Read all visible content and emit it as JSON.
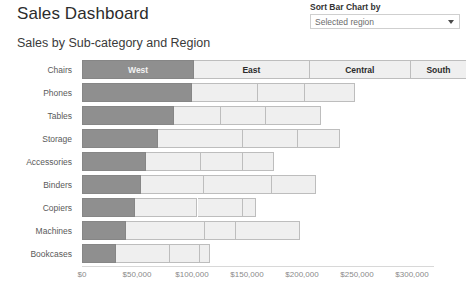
{
  "dashboard": {
    "title": "Sales Dashboard",
    "sheet_title": "Sales by Sub-category and Region"
  },
  "sort_control": {
    "label": "Sort Bar Chart by",
    "value": "Selected region",
    "caret_icon": "chevron-down-icon"
  },
  "colors": {
    "west_fill": "#8f8f8f",
    "other_fill": "#efefef",
    "border": "#bdbdbd",
    "text": "#5a5a5a"
  },
  "chart_data": {
    "type": "bar",
    "subtype": "stacked-horizontal",
    "title": "Sales by Sub-category and Region",
    "xlabel": "",
    "ylabel": "",
    "xlim": [
      0,
      320000
    ],
    "grid": false,
    "legend_position": "top-inline-first-row",
    "regions": [
      "West",
      "East",
      "Central",
      "South"
    ],
    "categories": [
      "Chairs",
      "Phones",
      "Tables",
      "Storage",
      "Accessories",
      "Binders",
      "Copiers",
      "Machines",
      "Bookcases"
    ],
    "tick_labels": [
      "$0",
      "$50,000",
      "$100,000",
      "$150,000",
      "$200,000",
      "$250,000",
      "$300,000"
    ],
    "tick_values": [
      0,
      50000,
      100000,
      150000,
      200000,
      250000,
      300000
    ],
    "series": [
      {
        "name": "West",
        "values": [
          102000,
          100000,
          84000,
          69000,
          58000,
          54000,
          48000,
          40000,
          31000
        ]
      },
      {
        "name": "East",
        "values": [
          105000,
          60000,
          42000,
          77000,
          50000,
          57000,
          57000,
          72000,
          49000
        ]
      },
      {
        "name": "Central",
        "values": [
          92000,
          43000,
          41000,
          50000,
          38000,
          62000,
          41000,
          28000,
          27000
        ]
      },
      {
        "name": "South",
        "values": [
          51000,
          45000,
          50000,
          39000,
          29000,
          40000,
          12000,
          58000,
          9000
        ]
      }
    ],
    "rows": [
      {
        "category": "Chairs",
        "segments": [
          {
            "region": "West",
            "value": 102000,
            "label": "West"
          },
          {
            "region": "East",
            "value": 105000,
            "label": "East"
          },
          {
            "region": "Central",
            "value": 92000,
            "label": "Central"
          },
          {
            "region": "South",
            "value": 51000,
            "label": "South"
          }
        ]
      },
      {
        "category": "Phones",
        "segments": [
          {
            "region": "West",
            "value": 100000,
            "label": ""
          },
          {
            "region": "East",
            "value": 60000,
            "label": ""
          },
          {
            "region": "Central",
            "value": 43000,
            "label": ""
          },
          {
            "region": "South",
            "value": 45000,
            "label": ""
          }
        ]
      },
      {
        "category": "Tables",
        "segments": [
          {
            "region": "West",
            "value": 84000,
            "label": ""
          },
          {
            "region": "East",
            "value": 42000,
            "label": ""
          },
          {
            "region": "Central",
            "value": 41000,
            "label": ""
          },
          {
            "region": "South",
            "value": 50000,
            "label": ""
          }
        ]
      },
      {
        "category": "Storage",
        "segments": [
          {
            "region": "West",
            "value": 69000,
            "label": ""
          },
          {
            "region": "East",
            "value": 77000,
            "label": ""
          },
          {
            "region": "Central",
            "value": 50000,
            "label": ""
          },
          {
            "region": "South",
            "value": 39000,
            "label": ""
          }
        ]
      },
      {
        "category": "Accessories",
        "segments": [
          {
            "region": "West",
            "value": 58000,
            "label": ""
          },
          {
            "region": "East",
            "value": 50000,
            "label": ""
          },
          {
            "region": "Central",
            "value": 38000,
            "label": ""
          },
          {
            "region": "South",
            "value": 29000,
            "label": ""
          }
        ]
      },
      {
        "category": "Binders",
        "segments": [
          {
            "region": "West",
            "value": 54000,
            "label": ""
          },
          {
            "region": "East",
            "value": 57000,
            "label": ""
          },
          {
            "region": "Central",
            "value": 62000,
            "label": ""
          },
          {
            "region": "South",
            "value": 40000,
            "label": ""
          }
        ]
      },
      {
        "category": "Copiers",
        "segments": [
          {
            "region": "West",
            "value": 48000,
            "label": ""
          },
          {
            "region": "East",
            "value": 57000,
            "label": ""
          },
          {
            "region": "Central",
            "value": 41000,
            "label": ""
          },
          {
            "region": "South",
            "value": 12000,
            "label": ""
          }
        ]
      },
      {
        "category": "Machines",
        "segments": [
          {
            "region": "West",
            "value": 40000,
            "label": ""
          },
          {
            "region": "East",
            "value": 72000,
            "label": ""
          },
          {
            "region": "Central",
            "value": 28000,
            "label": ""
          },
          {
            "region": "South",
            "value": 58000,
            "label": ""
          }
        ]
      },
      {
        "category": "Bookcases",
        "segments": [
          {
            "region": "West",
            "value": 31000,
            "label": ""
          },
          {
            "region": "East",
            "value": 49000,
            "label": ""
          },
          {
            "region": "Central",
            "value": 27000,
            "label": ""
          },
          {
            "region": "South",
            "value": 9000,
            "label": ""
          }
        ]
      }
    ]
  }
}
